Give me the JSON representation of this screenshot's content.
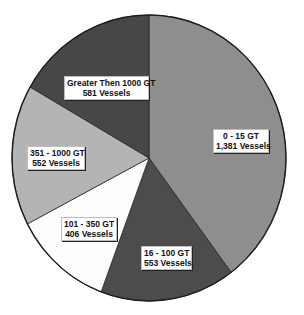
{
  "chart_data": {
    "type": "pie",
    "title": "",
    "start_angle_deg": 0,
    "direction": "clockwise",
    "categories": [
      "0 - 15 GT",
      "16 - 100 GT",
      "101 - 350 GT",
      "351 - 1000 GT",
      "Greater Then 1000 GT"
    ],
    "values": [
      1381,
      553,
      406,
      552,
      581
    ],
    "value_labels": [
      "1,381 Vessels",
      "553 Vessels",
      "406 Vessels",
      "552 Vessels",
      "581 Vessels"
    ],
    "colors": [
      "#8e8e8e",
      "#4c4c4c",
      "#fdfdfd",
      "#b4b4b4",
      "#474747"
    ],
    "legend": "none (labels on slices)",
    "total": 3473
  },
  "labels": [
    {
      "category": "0 - 15 GT",
      "count": "1,381 Vessels"
    },
    {
      "category": "16 - 100 GT",
      "count": "553 Vessels"
    },
    {
      "category": "101 - 350 GT",
      "count": "406 Vessels"
    },
    {
      "category": "351 - 1000 GT",
      "count": "552 Vessels"
    },
    {
      "category": "Greater Then 1000 GT",
      "count": "581 Vessels"
    }
  ]
}
